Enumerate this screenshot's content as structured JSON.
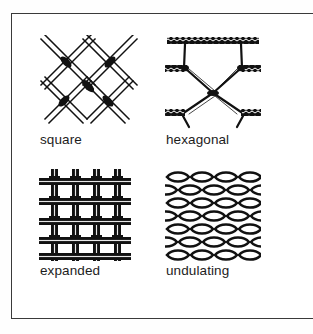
{
  "figure": {
    "background_color": "#ffffff",
    "frame_color": "#3a3a3a",
    "ink_color": "#111111",
    "panels": [
      {
        "id": "square",
        "label": "square",
        "pattern": "diagonal double-line lattice with X crossings",
        "icon": "square-mesh-icon"
      },
      {
        "id": "hexagonal",
        "label": "hexagonal",
        "pattern": "honeycomb chicken-wire with twisted horizontal bars",
        "icon": "hexagonal-mesh-icon"
      },
      {
        "id": "expanded",
        "label": "expanded",
        "pattern": "orthogonal woven grid of vertical and horizontal wires",
        "icon": "expanded-mesh-icon"
      },
      {
        "id": "undulating",
        "label": "undulating",
        "pattern": "dense staggered rows of lens-shaped diamond cells",
        "icon": "undulating-mesh-icon"
      }
    ]
  }
}
